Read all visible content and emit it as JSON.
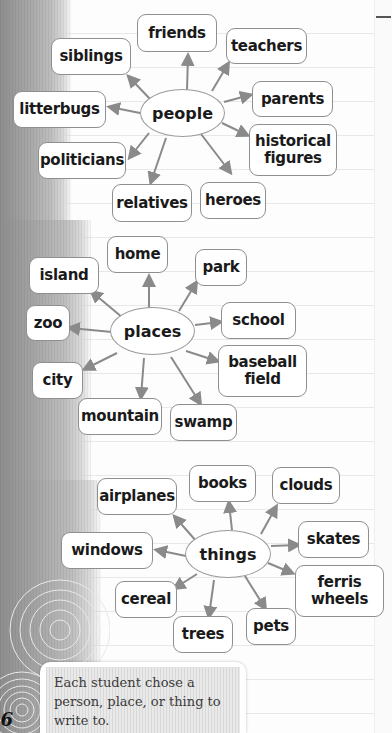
{
  "maps": [
    {
      "center": "people",
      "items": [
        "friends",
        "teachers",
        "parents",
        "historical figures",
        "heroes",
        "relatives",
        "politicians",
        "litterbugs",
        "siblings"
      ]
    },
    {
      "center": "places",
      "items": [
        "home",
        "park",
        "school",
        "baseball field",
        "swamp",
        "mountain",
        "city",
        "zoo",
        "island"
      ]
    },
    {
      "center": "things",
      "items": [
        "books",
        "clouds",
        "skates",
        "ferris wheels",
        "pets",
        "trees",
        "cereal",
        "windows",
        "airplanes"
      ]
    }
  ],
  "nodes": {
    "people": "people",
    "friends": "friends",
    "teachers": "teachers",
    "parents": "parents",
    "historical_1": "historical",
    "historical_2": "figures",
    "heroes": "heroes",
    "relatives": "relatives",
    "politicians": "politicians",
    "litterbugs": "litterbugs",
    "siblings": "siblings",
    "places": "places",
    "home": "home",
    "park": "park",
    "school": "school",
    "baseball_1": "baseball",
    "baseball_2": "field",
    "swamp": "swamp",
    "mountain": "mountain",
    "city": "city",
    "zoo": "zoo",
    "island": "island",
    "things": "things",
    "books": "books",
    "clouds": "clouds",
    "skates": "skates",
    "ferris_1": "ferris",
    "ferris_2": "wheels",
    "pets": "pets",
    "trees": "trees",
    "cereal": "cereal",
    "windows": "windows",
    "airplanes": "airplanes"
  },
  "caption": "Each student chose a person, place, or thing to write to.",
  "page_number": "16",
  "colors": {
    "arrow": "#8a8a8a",
    "node_border": "#8f8f8f"
  }
}
